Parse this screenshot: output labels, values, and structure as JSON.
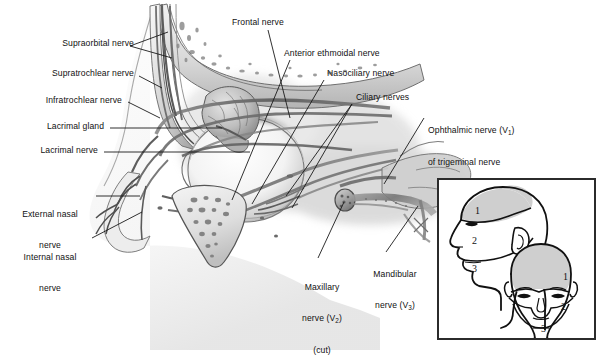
{
  "figure": {
    "background_color": "#ffffff",
    "ink_color": "#111111"
  },
  "labels": {
    "supraorbital": "Supraorbital nerve",
    "supratrochlear": "Supratrochlear nerve",
    "infratrochlear": "Infratrochlear nerve",
    "lacrimal_gland": "Lacrimal gland",
    "lacrimal_nerve": "Lacrimal nerve",
    "external_nasal_line1": "External nasal",
    "external_nasal_line2": "nerve",
    "internal_nasal_line1": "Internal nasal",
    "internal_nasal_line2": "nerve",
    "frontal": "Frontal nerve",
    "anterior_ethmoidal": "Anterior ethmoidal nerve",
    "nasociliary": "Nasociliary nerve",
    "ciliary": "Ciliary nerves",
    "ophthalmic_line1_pre": "Ophthalmic nerve (V",
    "ophthalmic_line1_sub": "1",
    "ophthalmic_line1_post": ")",
    "ophthalmic_line2": "of trigeminal nerve",
    "maxillary_line1": "Maxillary",
    "maxillary_line2_pre": "nerve (V",
    "maxillary_line2_sub": "2",
    "maxillary_line2_post": ")",
    "maxillary_line3": "(cut)",
    "mandibular_line1": "Mandibular",
    "mandibular_line2_pre": "nerve (V",
    "mandibular_line2_sub": "3",
    "mandibular_line2_post": ")"
  },
  "inset": {
    "name": "trigeminal-dermatome-map",
    "border_color": "#2b2b2b",
    "shade_color": "#cfcfcf",
    "lateral_head": {
      "view": "lateral",
      "zones": [
        "1",
        "2",
        "3"
      ]
    },
    "frontal_head": {
      "view": "frontal",
      "zones": [
        "1",
        "2",
        "3"
      ]
    }
  }
}
